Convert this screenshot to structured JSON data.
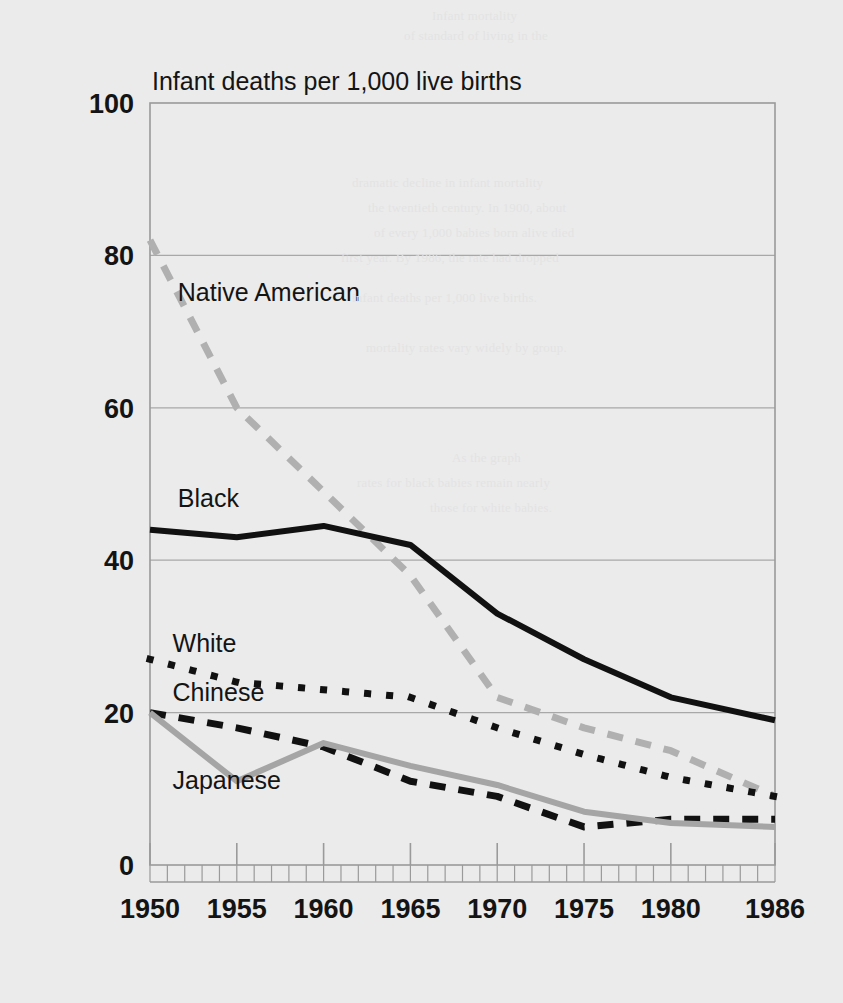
{
  "figure": {
    "title": "Infant deaths per 1,000 live births",
    "background_color": "#ebebeb",
    "plot_border_color": "#9a9a9a",
    "gridline_color": "#a8a8a8"
  },
  "ghost_text": [
    "Infant mortality",
    "of standard of living in the",
    "dramatic decline in infant mortality",
    "the twentieth century. In 1900, about",
    "of every 1,000 babies born alive died",
    "first year. By 1986, the rate had dropped",
    "infant deaths per 1,000 live births.",
    "mortality rates vary widely by group.",
    "As the graph",
    "rates for black babies remain nearly",
    "those for white babies."
  ],
  "axes": {
    "y": {
      "label_values": [
        "0",
        "20",
        "40",
        "60",
        "80",
        "100"
      ],
      "min": 0,
      "max": 100,
      "tick_step": 20,
      "gridlines_at": [
        20,
        40,
        60,
        80
      ]
    },
    "x": {
      "label_values": [
        "1950",
        "1955",
        "1960",
        "1965",
        "1970",
        "1975",
        "1980",
        "1986"
      ],
      "tick_years": [
        1950,
        1955,
        1960,
        1965,
        1970,
        1975,
        1980,
        1986
      ],
      "min": 1950,
      "max": 1986,
      "minor_tick_step": 1
    }
  },
  "chart_data": {
    "type": "line",
    "title": "Infant deaths per 1,000 live births",
    "xlabel": "",
    "ylabel": "Infant deaths per 1,000 live births",
    "xlim": [
      1950,
      1986
    ],
    "ylim": [
      0,
      100
    ],
    "grid": true,
    "legend_position": "inline-labels",
    "x": [
      1950,
      1955,
      1960,
      1965,
      1970,
      1975,
      1980,
      1986
    ],
    "series": [
      {
        "name": "Native American",
        "label": "Native American",
        "style": "dashed",
        "color": "#b0b0b0",
        "width": 7,
        "label_x": 1951.6,
        "label_y": 74,
        "values": [
          82,
          60,
          49,
          38,
          22,
          18,
          15,
          9
        ]
      },
      {
        "name": "Black",
        "label": "Black",
        "style": "solid",
        "color": "#111111",
        "width": 6,
        "label_x": 1951.6,
        "label_y": 47,
        "values": [
          44,
          43,
          44.5,
          42,
          33,
          27,
          22,
          19
        ]
      },
      {
        "name": "White",
        "label": "White",
        "style": "dotted",
        "color": "#111111",
        "width": 7,
        "label_x": 1951.3,
        "label_y": 28,
        "values": [
          27,
          24,
          23,
          22,
          18,
          14.5,
          11.5,
          9
        ]
      },
      {
        "name": "Chinese",
        "label": "Chinese",
        "style": "dashed",
        "color": "#111111",
        "width": 7,
        "label_x": 1951.3,
        "label_y": 21.5,
        "values": [
          20,
          18,
          15.5,
          11,
          9,
          5,
          6,
          6
        ]
      },
      {
        "name": "Japanese",
        "label": "Japanese",
        "style": "solid",
        "color": "#a5a5a5",
        "width": 6,
        "label_x": 1951.3,
        "label_y": 10,
        "values": [
          20,
          11,
          16,
          13,
          10.5,
          7,
          5.5,
          5
        ]
      }
    ]
  }
}
